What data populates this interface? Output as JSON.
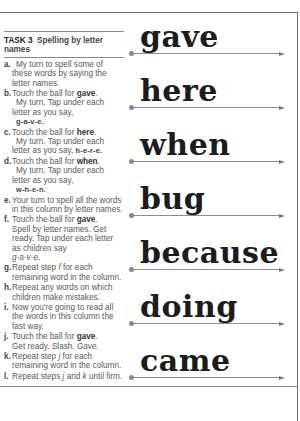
{
  "task": {
    "number": "TASK 3",
    "title": "Spelling by letter names"
  },
  "steps": [
    {
      "letter": "a.",
      "text": "My turn to spell some of these words by saying the letter names."
    },
    {
      "letter": "b.",
      "pre": "Touch the ball for ",
      "word": "gave",
      "post": ".",
      "line2": "My turn.  Tap under each letter as you say,",
      "spell": "g-a-v-e."
    },
    {
      "letter": "c.",
      "pre": "Touch the ball for ",
      "word": "here",
      "post": ".",
      "line2": "My turn.  Tap under each letter as you say,",
      "spell": "h-e-r-e."
    },
    {
      "letter": "d.",
      "pre": "Touch the ball for ",
      "word": "when",
      "post": ".",
      "line2": "My turn.  Tap under each letter as you say,",
      "spell": "w-h-e-n."
    },
    {
      "letter": "e.",
      "text": "Your turn to spell all the words in this column by letter names."
    },
    {
      "letter": "f.",
      "pre": "Touch the ball for ",
      "word": "gave",
      "post": ".",
      "line2": "Spell by letter names. Get ready.  Tap under each letter as children say",
      "spell_italic": "g-a-v-e."
    },
    {
      "letter": "g.",
      "pre": "Repeat step ",
      "ref": "f",
      "post": " for each remaining word in the column."
    },
    {
      "letter": "h.",
      "text": "Repeat any words on which children make mistakes."
    },
    {
      "letter": "i.",
      "text": "Now you're going to read all the words in this column the fast way."
    },
    {
      "letter": "j.",
      "pre": "Touch the ball for ",
      "word": "gave",
      "post": ".",
      "line2_pre": "Get ready.  Slash. ",
      "line2_italic": "Gave."
    },
    {
      "letter": "k.",
      "pre": "Repeat step ",
      "ref": "j",
      "post": " for each remaining word in the column."
    },
    {
      "letter": "l.",
      "pre": "Repeat steps ",
      "ref": "j",
      "mid": " and ",
      "ref2": "k",
      "post": " until firm."
    }
  ],
  "word_column": {
    "words": [
      "gave",
      "here",
      "when",
      "bug",
      "because",
      "doing",
      "came"
    ]
  },
  "colors": {
    "rule": "#6b6b6b",
    "word_ink": "#1c1c1c",
    "instruction_ink": "#5a5a5a",
    "arrow": "#8d8d8d"
  }
}
